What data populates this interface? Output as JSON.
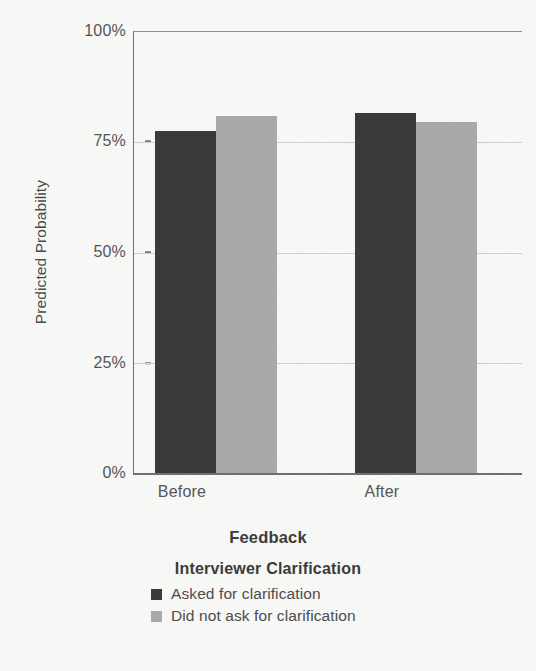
{
  "chart_data": {
    "type": "bar",
    "title": "",
    "xlabel": "Feedback",
    "ylabel": "Predicted Probability",
    "categories": [
      "Before",
      "After"
    ],
    "series": [
      {
        "name": "Asked for clarification",
        "values": [
          77.4,
          81.4
        ],
        "color": "#3a3a3a"
      },
      {
        "name": "Did not ask for clarification",
        "values": [
          80.8,
          79.4
        ],
        "color": "#a9a9a9"
      }
    ],
    "ylim": [
      0,
      100
    ],
    "yticks": [
      0,
      25,
      50,
      75,
      100
    ],
    "ytick_labels": [
      "0%",
      "25%",
      "50%",
      "75%",
      "100%"
    ],
    "grid": "horizontal",
    "legend_position": "bottom",
    "legend_title": "Interviewer Clarification"
  },
  "axes": {
    "y_title": "Predicted Probability",
    "x_title": "Feedback",
    "y_ticks": [
      {
        "label": "100%",
        "value": 100
      },
      {
        "label": "75%",
        "value": 75
      },
      {
        "label": "50%",
        "value": 50
      },
      {
        "label": "25%",
        "value": 25
      },
      {
        "label": "0%",
        "value": 0
      }
    ],
    "x_ticks": [
      {
        "label": "Before"
      },
      {
        "label": "After"
      }
    ]
  },
  "legend": {
    "title": "Interviewer Clarification",
    "items": [
      {
        "label": "Asked for clarification",
        "swatch": "dark"
      },
      {
        "label": "Did not ask for clarification",
        "swatch": "light"
      }
    ]
  },
  "colors": {
    "dark_bar": "#3a3a3a",
    "light_bar": "#a9a9a9",
    "background": "#f7f7f5",
    "gridline": "#cfcfcf",
    "axis": "#6e6e6e"
  }
}
